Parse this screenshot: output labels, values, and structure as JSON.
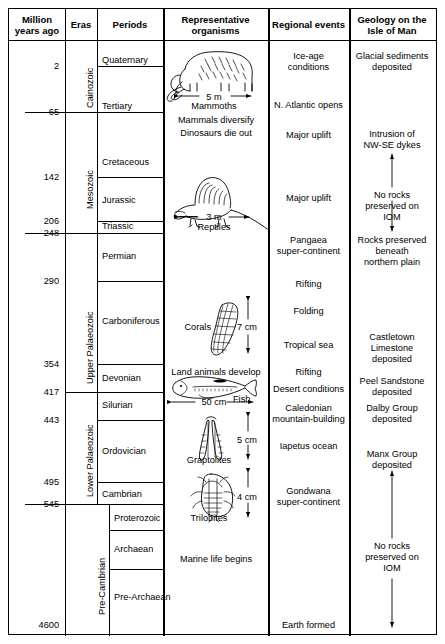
{
  "table": {
    "headers": [
      {
        "id": "million-years-ago",
        "label": "Million\nyears ago"
      },
      {
        "id": "eras",
        "label": "Eras"
      },
      {
        "id": "periods",
        "label": "Periods"
      },
      {
        "id": "representative-organisms",
        "label": "Representative\norganisms"
      },
      {
        "id": "regional-events",
        "label": "Regional events"
      },
      {
        "id": "geology-isle-of-man",
        "label": "Geology on the\nIsle of Man"
      }
    ],
    "age_ticks": [
      "2",
      "65",
      "142",
      "206",
      "248",
      "290",
      "354",
      "417",
      "443",
      "495",
      "545",
      "4600"
    ],
    "eras": [
      {
        "label": "Cainozoic"
      },
      {
        "label": "Mesozoic"
      },
      {
        "label": "Upper Palaeozoic"
      },
      {
        "label": "Lower Palaeozoic"
      },
      {
        "label": "Pre-Cambrian"
      }
    ],
    "periods": [
      "Quaternary",
      "Tertiary",
      "Cretaceous",
      "Jurassic",
      "Triassic",
      "Permian",
      "Carboniferous",
      "Devonian",
      "Silurian",
      "Ordovician",
      "Cambrian",
      "Proterozoic",
      "Archaean",
      "Pre-Archaean"
    ],
    "organisms": {
      "captions": [
        {
          "id": "mammoths",
          "scale": "5 m",
          "name": "Mammoths"
        },
        {
          "id": "reptiles",
          "scale": "3 m",
          "name": "Reptiles"
        },
        {
          "id": "corals",
          "scale": "7 cm",
          "name": "Corals"
        },
        {
          "id": "fish",
          "scale": "50 cm",
          "name": "Fish"
        },
        {
          "id": "graptolites",
          "scale": "5 cm",
          "name": "Graptolites"
        },
        {
          "id": "trilobites",
          "scale": "4 cm",
          "name": "Trilobites"
        }
      ],
      "notes": [
        "Mammals diversify",
        "Dinosaurs die out",
        "Land animals develop",
        "Marine life begins"
      ]
    },
    "regional_events": [
      "Ice-age\nconditions",
      "N. Atlantic opens",
      "Major uplift",
      "Major uplift",
      "Pangaea\nsuper-continent",
      "Rifting",
      "Folding",
      "Tropical sea",
      "Rifting",
      "Desert conditions",
      "Caledonian\nmountain-building",
      "Iapetus ocean",
      "Gondwana\nsuper-continent",
      "Earth formed"
    ],
    "geology": [
      "Glacial sediments\ndeposited",
      "Intrusion of\nNW-SE dykes",
      "No rocks\npreserved on\nIOM",
      "Rocks preserved\nbeneath\nnorthern plain",
      "Castletown\nLimestone\ndeposited",
      "Peel Sandstone\ndeposited",
      "Dalby Group\ndeposited",
      "Manx Group\ndeposited",
      "No rocks\npreserved on\nIOM"
    ]
  },
  "style": {
    "ink": "#000000",
    "paper": "#ffffff"
  }
}
